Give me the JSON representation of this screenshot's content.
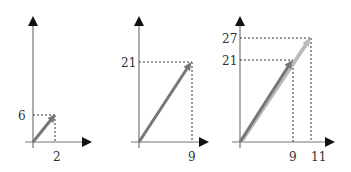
{
  "panels": [
    {
      "name": "panel-1",
      "point": {
        "x": 2,
        "y": 6
      },
      "x_label": "2",
      "y_label": "6"
    },
    {
      "name": "panel-2",
      "point": {
        "x": 9,
        "y": 21
      },
      "x_label": "9",
      "y_label": "21"
    },
    {
      "name": "panel-3",
      "points": [
        {
          "x": 9,
          "y": 21
        },
        {
          "x": 11,
          "y": 27
        }
      ],
      "x_labels": [
        "9",
        "11"
      ],
      "y_labels": [
        "21",
        "27"
      ]
    }
  ],
  "colors": {
    "axis": "#111111",
    "vector_dark": "#777777",
    "vector_light": "#bbbbbb",
    "guide": "#333333"
  }
}
